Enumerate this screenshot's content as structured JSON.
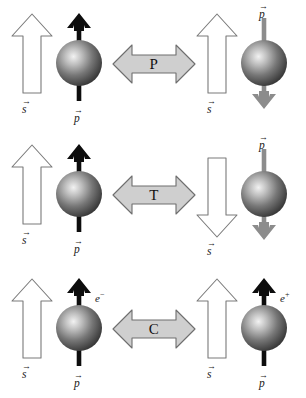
{
  "figure": {
    "background_color": "#ffffff"
  },
  "labels": {
    "spin_vector": "s",
    "momentum_vector": "p",
    "vector_arrow_glyph": "→",
    "electron": "e",
    "electron_charge": "−",
    "positron": "e",
    "positron_charge": "+"
  },
  "colors": {
    "sphere_dark": "#3a3a3a",
    "sphere_mid": "#8a8a8a",
    "sphere_highlight": "#f2f2f2",
    "momentum_black": "#0d0d0d",
    "momentum_gray": "#8c8c8c",
    "spin_outline": "#7a7a7a",
    "spin_fill": "#ffffff",
    "op_arrow_fill": "#cfcfcf",
    "op_arrow_stroke": "#6e6e6e",
    "text": "#1a1a1a"
  },
  "rows": [
    {
      "id": "parity",
      "operator": "P",
      "operator_name": "parity-operator",
      "left": {
        "spin_direction": "up",
        "spin_label": "s",
        "momentum_direction": "up",
        "momentum_color": "black",
        "momentum_label": "p",
        "momentum_label_position": "bottom",
        "charge_label": null
      },
      "right": {
        "spin_direction": "up",
        "spin_label": "s",
        "momentum_direction": "down",
        "momentum_color": "gray",
        "momentum_label": "p",
        "momentum_label_position": "top",
        "charge_label": null
      }
    },
    {
      "id": "time-reversal",
      "operator": "T",
      "operator_name": "time-reversal-operator",
      "left": {
        "spin_direction": "up",
        "spin_label": "s",
        "momentum_direction": "up",
        "momentum_color": "black",
        "momentum_label": "p",
        "momentum_label_position": "bottom",
        "charge_label": null
      },
      "right": {
        "spin_direction": "down",
        "spin_label": "s",
        "momentum_direction": "down",
        "momentum_color": "gray",
        "momentum_label": "p",
        "momentum_label_position": "top",
        "charge_label": null
      }
    },
    {
      "id": "charge-conjugation",
      "operator": "C",
      "operator_name": "charge-conjugation-operator",
      "left": {
        "spin_direction": "up",
        "spin_label": "s",
        "momentum_direction": "up",
        "momentum_color": "black",
        "momentum_label": "p",
        "momentum_label_position": "bottom",
        "charge_label": "e−"
      },
      "right": {
        "spin_direction": "up",
        "spin_label": "s",
        "momentum_direction": "up",
        "momentum_color": "black",
        "momentum_label": "p",
        "momentum_label_position": "bottom",
        "charge_label": "e+"
      }
    }
  ]
}
